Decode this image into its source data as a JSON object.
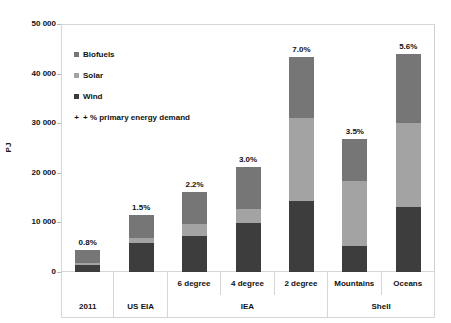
{
  "chart_data": {
    "type": "bar",
    "subtype": "stacked",
    "title": "",
    "xlabel": "",
    "ylabel": "PJ",
    "ylim": [
      0,
      50000
    ],
    "yticks": [
      "0",
      "10 000",
      "20 000",
      "30 000",
      "40 000",
      "50 000"
    ],
    "ytick_values": [
      0,
      10000,
      20000,
      30000,
      40000,
      50000
    ],
    "grid": false,
    "legend_position": "inside-top-left",
    "categories": [
      "2011",
      "US EIA",
      "6 degree",
      "4 degree",
      "2 degree",
      "Mountains",
      "Oceans"
    ],
    "group_labels": [
      "2011",
      "US EIA",
      "IEA",
      "Shell"
    ],
    "groups": [
      {
        "label": "2011",
        "span": 1
      },
      {
        "label": "US EIA",
        "span": 1
      },
      {
        "label": "IEA",
        "span": 3
      },
      {
        "label": "Shell",
        "span": 2
      }
    ],
    "series": [
      {
        "name": "Wind",
        "color": "#3d3d3d",
        "values": [
          1500,
          5900,
          7300,
          9800,
          14300,
          5300,
          13200
        ]
      },
      {
        "name": "Solar",
        "color": "#a3a3a3",
        "values": [
          300,
          900,
          2300,
          2900,
          16700,
          13100,
          16800
        ]
      },
      {
        "name": "Biofuels",
        "color": "#767676",
        "values": [
          2700,
          4700,
          6600,
          8500,
          12300,
          8400,
          14000
        ]
      }
    ],
    "totals": [
      4500,
      11500,
      16200,
      21200,
      43300,
      26800,
      44000
    ],
    "annotations": {
      "label": "+ % primary energy demand",
      "values": [
        "0.8%",
        "1.5%",
        "2.2%",
        "3.0%",
        "7.0%",
        "3.5%",
        "5.6%"
      ]
    }
  },
  "legend": {
    "items": [
      {
        "label": "Biofuels",
        "marker": "square",
        "color": "#767676"
      },
      {
        "label": "Solar",
        "marker": "square",
        "color": "#a3a3a3"
      },
      {
        "label": "Wind",
        "marker": "square",
        "color": "#3d3d3d"
      },
      {
        "label": "+ % primary energy demand",
        "marker": "plus",
        "color": "#111111"
      }
    ],
    "plus_glyph": "+"
  },
  "axis": {
    "y_title": "PJ"
  },
  "colors": {
    "wind": "#3d3d3d",
    "solar": "#a3a3a3",
    "biofuels": "#767676",
    "frame": "#d6d6d6",
    "text": "#111111",
    "background": "#ffffff"
  }
}
